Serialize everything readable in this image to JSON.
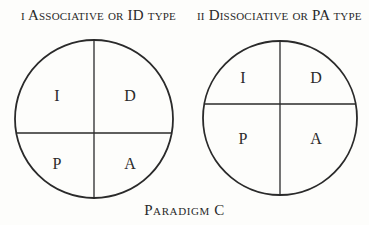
{
  "figure": {
    "caption": "Paradigm C",
    "panels": [
      {
        "title": "i Associative or ID type",
        "circle": {
          "cx": 94,
          "cy": 119,
          "r": 79
        },
        "vertical_divider_x": 94,
        "horizontal_divider_y": 133,
        "quadrants": [
          {
            "label": "I",
            "x": 57,
            "y": 101
          },
          {
            "label": "D",
            "x": 130,
            "y": 101
          },
          {
            "label": "P",
            "x": 57,
            "y": 169
          },
          {
            "label": "A",
            "x": 130,
            "y": 169
          }
        ]
      },
      {
        "title": "ii Dissociative or PA type",
        "circle": {
          "cx": 280,
          "cy": 118,
          "r": 77
        },
        "vertical_divider_x": 280,
        "horizontal_divider_y": 104,
        "quadrants": [
          {
            "label": "I",
            "x": 243,
            "y": 83
          },
          {
            "label": "D",
            "x": 316,
            "y": 83
          },
          {
            "label": "P",
            "x": 243,
            "y": 144
          },
          {
            "label": "A",
            "x": 316,
            "y": 144
          }
        ]
      }
    ]
  },
  "colors": {
    "line": "#2a2a2a",
    "background": "#fdfdfb"
  }
}
